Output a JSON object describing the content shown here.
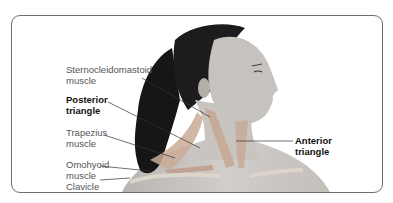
{
  "figure": {
    "colors": {
      "frame": "#6e6e6e",
      "hair": "#1a1a1a",
      "skin": "#c9c6c3",
      "skin_shadow": "#a9a5a1",
      "muscle": "#c7aa96",
      "leader_line": "#333333"
    }
  },
  "labels": [
    {
      "id": "scm",
      "line1": "Sternocleidomastoid",
      "line2": "muscle",
      "bold": false
    },
    {
      "id": "posterior",
      "line1": "Posterior",
      "line2": "triangle",
      "bold": true
    },
    {
      "id": "trapezius",
      "line1": "Trapezius",
      "line2": "muscle",
      "bold": false
    },
    {
      "id": "omohyoid",
      "line1": "Omohyoid",
      "line2": "muscle",
      "bold": false
    },
    {
      "id": "clavicle",
      "line1": "Clavicle",
      "line2": "",
      "bold": false
    },
    {
      "id": "anterior",
      "line1": "Anterior",
      "line2": "triangle",
      "bold": true
    }
  ]
}
